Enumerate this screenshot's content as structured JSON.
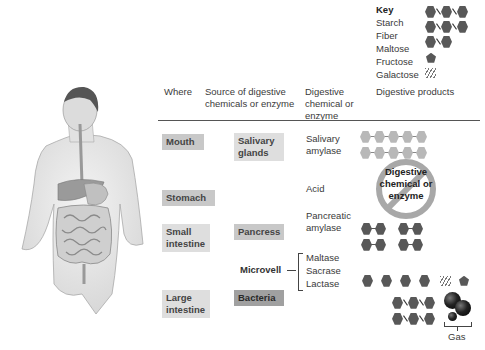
{
  "key": {
    "title": "Key",
    "items": [
      {
        "label": "Starch",
        "icon": "starch-chain-icon"
      },
      {
        "label": "Fiber",
        "icon": "fiber-chain-icon"
      },
      {
        "label": "Maltose",
        "icon": "maltose-pair-icon"
      },
      {
        "label": "Fructose",
        "icon": "fructose-pentagon-icon"
      },
      {
        "label": "Galactose",
        "icon": "galactose-hatch-icon"
      }
    ]
  },
  "headers": {
    "where": "Where",
    "source": "Source of digestive chemicals or enzyme",
    "chemical": "Digestive chemical or enzyme",
    "products": "Digestive products"
  },
  "rows": {
    "mouth": {
      "where": "Mouth",
      "source": "Salivary glands",
      "chemical": "Salivary amylase"
    },
    "stomach": {
      "where": "Stomach",
      "chemical": "Acid",
      "note": "Digestive chemical or enzyme"
    },
    "small_intestine": {
      "where": "Small intestine",
      "source": "Pancress",
      "chemical": "Pancreatic amylase"
    },
    "microvell": {
      "source": "Microvell",
      "chemicals": [
        "Maltase",
        "Sacrase",
        "Lactase"
      ]
    },
    "large_intestine": {
      "where": "Large intestine",
      "source": "Bacteria",
      "gas_label": "Gas"
    }
  },
  "colors": {
    "label_bg": "#c8c8c8",
    "label_bg_dark": "#a0a0a0",
    "hexagon": "#585858",
    "hexagon_light": "#b8b8b8",
    "no_sign": "#a8a8a8"
  }
}
